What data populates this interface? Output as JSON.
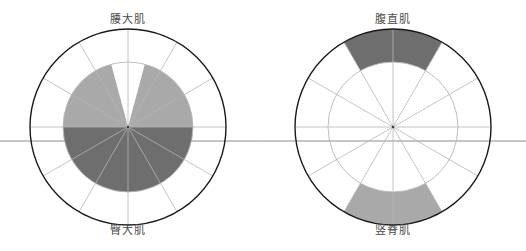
{
  "figure": {
    "background": "#ffffff",
    "width": 526,
    "height": 251,
    "baseline_y": 141,
    "baseline_color": "#8c8c8c"
  },
  "labels": {
    "left_top": "腰大肌",
    "left_bottom": "臀大肌",
    "right_top": "腹直肌",
    "right_bottom": "竖脊肌"
  },
  "colors": {
    "light_gray": "#a9a9a9",
    "dark_gray": "#6e6e6e",
    "outer_ring": "#1a1a1a",
    "inner_ring": "#b5b5b5",
    "spoke": "#b5b5b5",
    "label_text": "#4a4a4a"
  },
  "chart_data": {
    "type": "pie",
    "title": "",
    "subtitle": "",
    "xlabel": "",
    "ylabel": "",
    "grid": true,
    "legend_position": "none",
    "charts": [
      {
        "id": "left-diagram",
        "center": [
          128,
          127
        ],
        "outer_radius": 98,
        "inner_radius": 65,
        "spoke_count": 12,
        "spoke_step_deg": 30,
        "top_label": "腰大肌",
        "bottom_label": "臀大肌",
        "categories": [
          "腰大肌 upper-left",
          "腰大肌 upper-right",
          "臀大肌 lower"
        ],
        "values": [
          75,
          75,
          180
        ],
        "ylim": [
          0,
          65
        ],
        "sectors": [
          {
            "name": "腰大肌-upper-left",
            "label": "腰大肌",
            "start_deg": 105,
            "end_deg": 180,
            "sweep_deg": 75,
            "inner_r": 0,
            "outer_r": 65,
            "color": "#a9a9a9"
          },
          {
            "name": "腰大肌-upper-right",
            "label": "腰大肌",
            "start_deg": 0,
            "end_deg": 75,
            "sweep_deg": 75,
            "inner_r": 0,
            "outer_r": 65,
            "color": "#a9a9a9"
          },
          {
            "name": "臀大肌-lower",
            "label": "臀大肌",
            "start_deg": 180,
            "end_deg": 360,
            "sweep_deg": 180,
            "inner_r": 0,
            "outer_r": 65,
            "color": "#6e6e6e"
          }
        ]
      },
      {
        "id": "right-diagram",
        "center": [
          393,
          127
        ],
        "outer_radius": 98,
        "inner_radius": 65,
        "spoke_count": 12,
        "spoke_step_deg": 30,
        "top_label": "腹直肌",
        "bottom_label": "竖脊肌",
        "categories": [
          "腹直肌 upper",
          "竖脊肌 lower"
        ],
        "values": [
          60,
          60
        ],
        "ylim": [
          65,
          98
        ],
        "sectors": [
          {
            "name": "腹直肌-upper",
            "label": "腹直肌",
            "start_deg": 60,
            "end_deg": 120,
            "sweep_deg": 60,
            "inner_r": 65,
            "outer_r": 98,
            "color": "#6e6e6e"
          },
          {
            "name": "竖脊肌-lower",
            "label": "竖脊肌",
            "start_deg": 240,
            "end_deg": 300,
            "sweep_deg": 60,
            "inner_r": 65,
            "outer_r": 98,
            "color": "#a9a9a9"
          }
        ]
      }
    ]
  }
}
